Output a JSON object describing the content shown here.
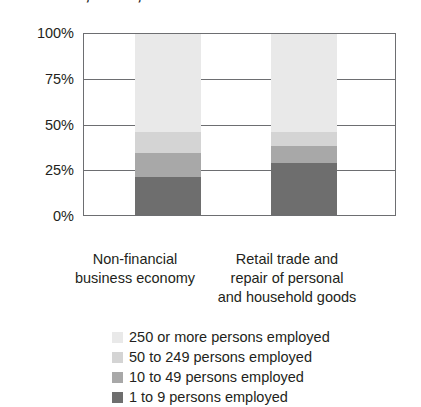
{
  "chart_data": {
    "type": "bar",
    "subtype": "100% stacked column",
    "title": "size class, EU-27, 2004",
    "xlabel": "",
    "ylabel": "",
    "ylim": [
      0,
      100
    ],
    "yticks": [
      0,
      25,
      50,
      75,
      100
    ],
    "ytick_labels": [
      "0%",
      "25%",
      "50%",
      "75%",
      "100%"
    ],
    "grid": true,
    "legend_position": "bottom-left",
    "units": "percent",
    "categories": [
      "Non-financial business economy",
      "Retail trade and repair of personal and household goods"
    ],
    "series": [
      {
        "name": "250 or more persons employed",
        "color": "#e9e9e9",
        "values": [
          54,
          54
        ]
      },
      {
        "name": "50 to 249 persons employed",
        "color": "#d4d4d4",
        "values": [
          12,
          8
        ]
      },
      {
        "name": "10 to 49 persons employed",
        "color": "#a8a8a8",
        "values": [
          13,
          9
        ]
      },
      {
        "name": "1 to 9 persons employed",
        "color": "#6e6e6e",
        "values": [
          21,
          29
        ]
      }
    ]
  },
  "axis": {
    "ticks": [
      {
        "label": "100%",
        "value": 100
      },
      {
        "label": "75%",
        "value": 75
      },
      {
        "label": "50%",
        "value": 50
      },
      {
        "label": "25%",
        "value": 25
      },
      {
        "label": "0%",
        "value": 0
      }
    ]
  },
  "category_labels": [
    "Non-financial\nbusiness economy",
    "Retail trade and\nrepair of personal\nand household goods"
  ],
  "legend": {
    "items": [
      {
        "label": "250 or more persons employed",
        "color": "#e9e9e9"
      },
      {
        "label": "50 to 249 persons employed",
        "color": "#d4d4d4"
      },
      {
        "label": "10 to 49 persons employed",
        "color": "#a8a8a8"
      },
      {
        "label": "1 to 9 persons employed",
        "color": "#6e6e6e"
      }
    ]
  }
}
